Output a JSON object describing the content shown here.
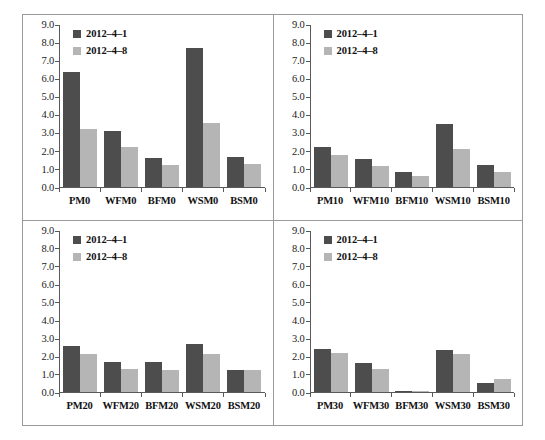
{
  "figure": {
    "series_colors": {
      "series_1": "#4d4d4d",
      "series_2": "#b5b5b5"
    },
    "legend_labels": [
      "2012–4–1",
      "2012–4–8"
    ],
    "y_ticks": [
      "9.0",
      "8.0",
      "7.0",
      "6.0",
      "5.0",
      "4.0",
      "3.0",
      "2.0",
      "1.0",
      "0.0"
    ]
  },
  "chart_data": [
    {
      "type": "bar",
      "title": "",
      "panel": "top-left",
      "categories": [
        "PM0",
        "WFM0",
        "BFM0",
        "WSM0",
        "BSM0"
      ],
      "series": [
        {
          "name": "2012–4–1",
          "color": "#4d4d4d",
          "values": [
            6.4,
            3.1,
            1.6,
            7.7,
            1.65
          ]
        },
        {
          "name": "2012–4–8",
          "color": "#b5b5b5",
          "values": [
            3.25,
            2.25,
            1.2,
            3.55,
            1.3
          ]
        }
      ],
      "xlabel": "",
      "ylabel": "",
      "ylim": [
        0,
        9
      ],
      "ytick_step": 1,
      "grid": false,
      "legend_position": "top-left"
    },
    {
      "type": "bar",
      "title": "",
      "panel": "top-right",
      "categories": [
        "PM10",
        "WFM10",
        "BFM10",
        "WSM10",
        "BSM10"
      ],
      "series": [
        {
          "name": "2012–4–1",
          "color": "#4d4d4d",
          "values": [
            2.25,
            1.55,
            0.85,
            3.5,
            1.25
          ]
        },
        {
          "name": "2012–4–8",
          "color": "#b5b5b5",
          "values": [
            1.8,
            1.15,
            0.6,
            2.1,
            0.85
          ]
        }
      ],
      "xlabel": "",
      "ylabel": "",
      "ylim": [
        0,
        9
      ],
      "ytick_step": 1,
      "grid": false,
      "legend_position": "top-left"
    },
    {
      "type": "bar",
      "title": "",
      "panel": "bottom-left",
      "categories": [
        "PM20",
        "WFM20",
        "BFM20",
        "WSM20",
        "BSM20"
      ],
      "series": [
        {
          "name": "2012–4–1",
          "color": "#4d4d4d",
          "values": [
            2.55,
            1.7,
            1.65,
            2.7,
            1.25
          ]
        },
        {
          "name": "2012–4–8",
          "color": "#b5b5b5",
          "values": [
            2.15,
            1.3,
            1.25,
            2.1,
            1.25
          ]
        }
      ],
      "xlabel": "",
      "ylabel": "",
      "ylim": [
        0,
        9
      ],
      "ytick_step": 1,
      "grid": false,
      "legend_position": "top-left"
    },
    {
      "type": "bar",
      "title": "",
      "panel": "bottom-right",
      "categories": [
        "PM30",
        "WFM30",
        "BFM30",
        "WSM30",
        "BSM30"
      ],
      "series": [
        {
          "name": "2012–4–1",
          "color": "#4d4d4d",
          "values": [
            2.4,
            1.6,
            0.03,
            2.35,
            0.5
          ]
        },
        {
          "name": "2012–4–8",
          "color": "#b5b5b5",
          "values": [
            2.2,
            1.3,
            0.03,
            2.15,
            0.7
          ]
        }
      ],
      "xlabel": "",
      "ylabel": "",
      "ylim": [
        0,
        9
      ],
      "ytick_step": 1,
      "grid": false,
      "legend_position": "top-left"
    }
  ]
}
